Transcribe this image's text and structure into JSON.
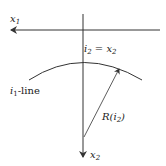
{
  "labels": {
    "x1": "x",
    "x1_sub": "1",
    "x2": "x",
    "x2_sub": "2",
    "peak_lhs": "i",
    "peak_lhs_sub": "2",
    "peak_eq": " = x",
    "peak_rhs_sub": "2",
    "line_label": "i",
    "line_label_sub": "1",
    "line_label_suffix": "-line",
    "radius": "R(i",
    "radius_sub": "2",
    "radius_close": ")"
  },
  "colors": {
    "stroke": "#333333",
    "background": "#ffffff"
  }
}
